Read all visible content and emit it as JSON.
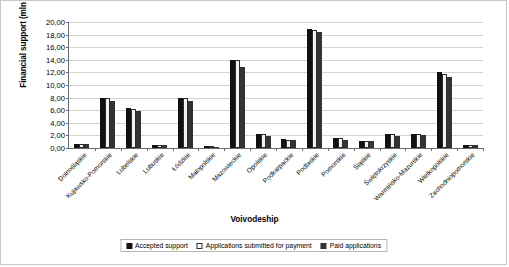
{
  "chart_data": {
    "type": "bar",
    "title": "",
    "xlabel": "Voivodeship",
    "ylabel": "Financial support (mln PLN)",
    "ylim": [
      0,
      20
    ],
    "ytick_step": 2,
    "ytick_labels": [
      "0,00",
      "2,00",
      "4,00",
      "6,00",
      "8,00",
      "10,00",
      "12,00",
      "14,00",
      "16,00",
      "18,00",
      "20,00"
    ],
    "grid": true,
    "legend_position": "bottom",
    "decimal_separator": ",",
    "categories": [
      "Dolnośląskie",
      "Kujawsko-Pomorskie",
      "Lubelskie",
      "Lubuskie",
      "Łódzkie",
      "Małopolskie",
      "Mazowieckie",
      "Opolskie",
      "Podkarpackie",
      "Podlaskie",
      "Pomorskie",
      "Śląskie",
      "Świętokrzyskie",
      "Warmińsko-Mazurskie",
      "Wielkopolskie",
      "Zachodniopomorskie"
    ],
    "series": [
      {
        "name": "Accepted support",
        "color": "#111111",
        "values": [
          0.6,
          8.0,
          6.3,
          0.55,
          7.9,
          0.35,
          13.95,
          2.2,
          1.45,
          18.85,
          1.6,
          1.05,
          2.15,
          2.3,
          12.0,
          0.55
        ]
      },
      {
        "name": "Applications submitted for payment",
        "color": "#ffffff",
        "values": [
          0.6,
          8.0,
          6.15,
          0.45,
          7.9,
          0.25,
          13.9,
          2.15,
          1.35,
          18.8,
          1.6,
          1.05,
          2.15,
          2.25,
          11.8,
          0.55
        ]
      },
      {
        "name": "Paid applications",
        "color": "#333333",
        "values": [
          0.6,
          7.4,
          5.8,
          0.4,
          7.4,
          0.22,
          12.9,
          1.9,
          1.25,
          18.4,
          1.25,
          1.05,
          1.95,
          2.0,
          11.2,
          0.55
        ]
      }
    ]
  }
}
